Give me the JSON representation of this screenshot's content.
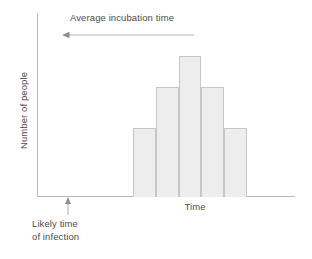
{
  "chart_data": {
    "type": "bar",
    "title": "",
    "subtitle": "",
    "xlabel": "Time",
    "ylabel": "Number of people",
    "categories": [
      "1",
      "2",
      "3",
      "4",
      "5"
    ],
    "values": [
      44,
      70,
      90,
      70,
      44
    ],
    "ylim": [
      0,
      100
    ],
    "xlim": [
      0,
      1
    ],
    "grid": false,
    "legend": null,
    "bar_fill_color": "#ededed",
    "bar_border_color": "#c6c6c6",
    "axis_color": "#b9b9b9",
    "text_color": "#4d4d4d",
    "background_color": "#ffffff",
    "annotations": [
      {
        "name": "average-incubation-time",
        "text": "Average incubation time",
        "arrow_direction": "left",
        "position": "top"
      },
      {
        "name": "likely-time-of-infection",
        "text_lines": [
          "Likely time",
          "of infection"
        ],
        "arrow_direction": "up",
        "position": "below-x-axis"
      }
    ]
  },
  "labels": {
    "y_axis": "Number of people",
    "x_axis": "Time",
    "incubation": "Average incubation time",
    "infection_line1": "Likely time",
    "infection_line2": "of infection"
  }
}
